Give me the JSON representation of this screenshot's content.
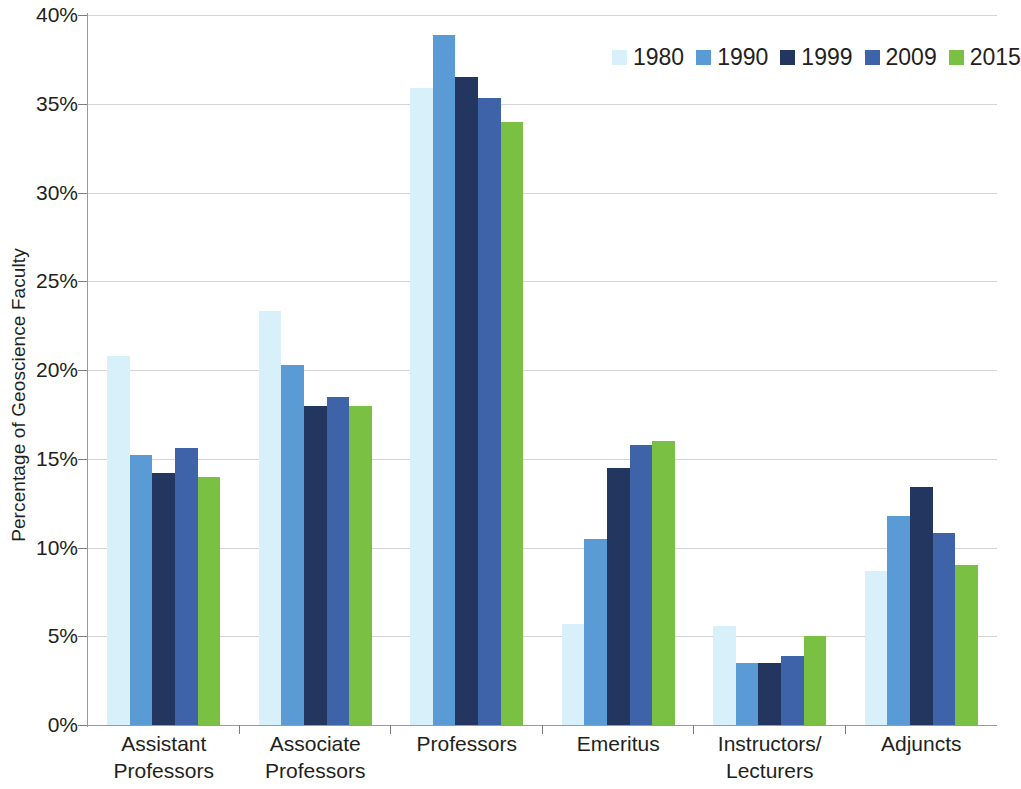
{
  "chart_data": {
    "type": "bar",
    "title": "",
    "xlabel": "",
    "ylabel": "Percentage of Geoscience Faculty",
    "ylim": [
      0,
      40
    ],
    "ytick_labels": [
      "0%",
      "5%",
      "10%",
      "15%",
      "20%",
      "25%",
      "30%",
      "35%",
      "40%"
    ],
    "ytick_values": [
      0,
      5,
      10,
      15,
      20,
      25,
      30,
      35,
      40
    ],
    "grid": true,
    "legend_position": "top-right",
    "value_unit": "%",
    "categories": [
      "Assistant Professors",
      "Associate Professors",
      "Professors",
      "Emeritus",
      "Instructors/Lecturers",
      "Adjuncts"
    ],
    "category_lines": [
      [
        "Assistant",
        "Professors"
      ],
      [
        "Associate",
        "Professors"
      ],
      [
        "Professors",
        ""
      ],
      [
        "Emeritus",
        ""
      ],
      [
        "Instructors/",
        "Lecturers"
      ],
      [
        "Adjuncts",
        ""
      ]
    ],
    "series": [
      {
        "name": "1980",
        "color": "#d8f0fa",
        "values": [
          20.8,
          23.3,
          35.9,
          5.7,
          5.6,
          8.7
        ]
      },
      {
        "name": "1990",
        "color": "#5b9bd5",
        "values": [
          15.2,
          20.3,
          38.9,
          10.5,
          3.5,
          11.8
        ]
      },
      {
        "name": "1999",
        "color": "#22365f",
        "values": [
          14.2,
          18.0,
          36.5,
          14.5,
          3.5,
          13.4
        ]
      },
      {
        "name": "2009",
        "color": "#3f63a8",
        "values": [
          15.6,
          18.5,
          35.3,
          15.8,
          3.9,
          10.8
        ]
      },
      {
        "name": "2015",
        "color": "#7ac143",
        "values": [
          14.0,
          18.0,
          34.0,
          16.0,
          5.0,
          9.0
        ]
      }
    ]
  },
  "legend": {
    "items": [
      {
        "label": "1980",
        "color": "#d8f0fa"
      },
      {
        "label": "1990",
        "color": "#5b9bd5"
      },
      {
        "label": "1999",
        "color": "#22365f"
      },
      {
        "label": "2009",
        "color": "#3f63a8"
      },
      {
        "label": "2015",
        "color": "#7ac143"
      }
    ]
  },
  "axis": {
    "y_title": "Percentage of Geoscience Faculty"
  },
  "colors": {
    "gridline": "#d4d4d4",
    "axis": "#9a9a9a",
    "text": "#231f20",
    "background": "#ffffff"
  }
}
